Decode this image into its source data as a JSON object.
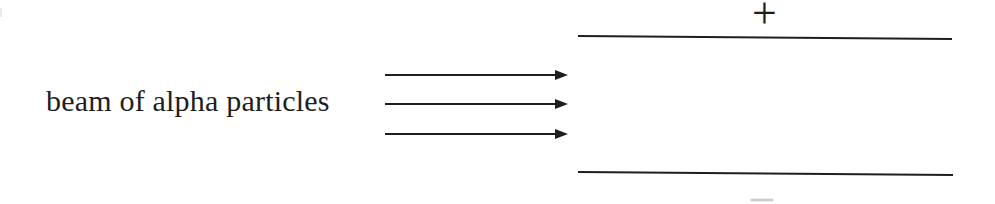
{
  "diagram": {
    "beam_label": "beam of alpha particles",
    "arrows": {
      "count": 3,
      "direction": "right"
    },
    "plates": {
      "top_charge_symbol": "+",
      "bottom_charge_symbol": "−"
    },
    "colors": {
      "ink": "#1e1e1e",
      "faint_minus": "#c9c9c9",
      "background": "#ffffff"
    }
  }
}
